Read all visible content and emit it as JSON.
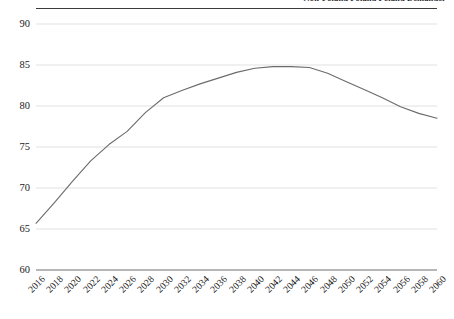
{
  "figure": {
    "caption": "Non-Poland Poland Poland Demander",
    "caption_visible_note": "text clipped at top edge of image"
  },
  "chart_data": {
    "type": "line",
    "title": "",
    "subtitle": "",
    "xlabel": "",
    "ylabel": "",
    "xlim": [
      2016,
      2060
    ],
    "ylim": [
      60,
      90
    ],
    "yticks": [
      60,
      65,
      70,
      75,
      80,
      85,
      90
    ],
    "ytick_labels": [
      "60",
      "65",
      "70",
      "75",
      "80",
      "85",
      "90"
    ],
    "grid": true,
    "grid_axis": "y",
    "legend": false,
    "legend_position": "none",
    "line_color": "#6b6b6b",
    "line_width": 1.1,
    "markers": false,
    "categories": [
      "2016",
      "2018",
      "2020",
      "2022",
      "2024",
      "2026",
      "2028",
      "2030",
      "2032",
      "2034",
      "2036",
      "2038",
      "2040",
      "2042",
      "2044",
      "2046",
      "2048",
      "2050",
      "2052",
      "2054",
      "2056",
      "2058",
      "2060"
    ],
    "x": [
      2016,
      2018,
      2020,
      2022,
      2024,
      2026,
      2028,
      2030,
      2032,
      2034,
      2036,
      2038,
      2040,
      2042,
      2044,
      2046,
      2048,
      2050,
      2052,
      2054,
      2056,
      2058,
      2060
    ],
    "values": [
      65.7,
      68.2,
      70.8,
      73.3,
      75.3,
      76.9,
      79.2,
      81.0,
      81.9,
      82.7,
      83.4,
      84.1,
      84.6,
      84.8,
      84.8,
      84.7,
      84.0,
      83.0,
      82.0,
      81.0,
      79.9,
      79.1,
      78.5
    ],
    "series": [
      {
        "name": "",
        "values": [
          65.7,
          68.2,
          70.8,
          73.3,
          75.3,
          76.9,
          79.2,
          81.0,
          81.9,
          82.7,
          83.4,
          84.1,
          84.6,
          84.8,
          84.8,
          84.7,
          84.0,
          83.0,
          82.0,
          81.0,
          79.9,
          79.1,
          78.5
        ],
        "color": "#6b6b6b"
      }
    ],
    "annotations": []
  },
  "colors": {
    "line": "#6b6b6b",
    "grid": "#d9d9d9",
    "axis": "#6e6e6e",
    "rule": "#3a3a3a",
    "text": "#1a1a1a",
    "background": "#ffffff"
  }
}
